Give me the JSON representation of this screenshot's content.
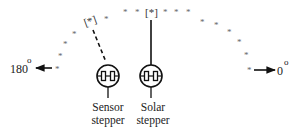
{
  "diagram": {
    "title": "",
    "arc": {
      "symbol": "*",
      "points": [
        {
          "x": 58,
          "y": 68
        },
        {
          "x": 60,
          "y": 55
        },
        {
          "x": 66,
          "y": 43
        },
        {
          "x": 75,
          "y": 33
        },
        {
          "x": 89,
          "y": 21,
          "bracketed": true,
          "label": "[*]",
          "role": "sensor-position"
        },
        {
          "x": 106,
          "y": 18
        },
        {
          "x": 126,
          "y": 11
        },
        {
          "x": 138,
          "y": 11
        },
        {
          "x": 151,
          "y": 11,
          "bracketed": true,
          "label": "[*]",
          "role": "solar-position"
        },
        {
          "x": 165,
          "y": 11
        },
        {
          "x": 176,
          "y": 11
        },
        {
          "x": 188,
          "y": 11
        },
        {
          "x": 202,
          "y": 21
        },
        {
          "x": 216,
          "y": 24
        },
        {
          "x": 229,
          "y": 31
        },
        {
          "x": 239,
          "y": 41
        },
        {
          "x": 246,
          "y": 54
        },
        {
          "x": 249,
          "y": 69
        }
      ]
    },
    "left_direction": {
      "label": "180",
      "superscript": "o",
      "arrow": "left"
    },
    "right_direction": {
      "label": "0",
      "superscript": "o",
      "arrow": "right"
    },
    "steppers": [
      {
        "id": "sensor",
        "line1": "Sensor",
        "line2": "stepper",
        "link_style": "dashed"
      },
      {
        "id": "solar",
        "line1": "Solar",
        "line2": "stepper",
        "link_style": "solid"
      }
    ]
  }
}
